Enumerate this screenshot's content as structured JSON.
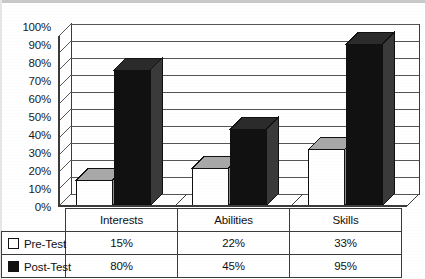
{
  "chart_data": {
    "type": "bar",
    "title": "",
    "subtitle": "",
    "xlabel": "",
    "ylabel": "",
    "categories": [
      "Interests",
      "Abilities",
      "Skills"
    ],
    "series": [
      {
        "name": "Pre-Test",
        "values": [
          15,
          22,
          33
        ],
        "color": "#ffffff",
        "marker": "hollow-square"
      },
      {
        "name": "Post-Test",
        "values": [
          80,
          45,
          95
        ],
        "color": "#111111",
        "marker": "filled-square"
      }
    ],
    "value_labels": {
      "Pre-Test": [
        "15%",
        "22%",
        "33%"
      ],
      "Post-Test": [
        "80%",
        "45%",
        "95%"
      ]
    },
    "ylim": [
      0,
      100
    ],
    "ytick_step": 10,
    "ytick_labels": [
      "100%",
      "90%",
      "80%",
      "70%",
      "60%",
      "50%",
      "40%",
      "30%",
      "20%",
      "10%",
      "0%"
    ],
    "ytick_values": [
      100,
      90,
      80,
      70,
      60,
      50,
      40,
      30,
      20,
      10,
      0
    ],
    "grid": true,
    "grid_axis": "y",
    "legend_position": "data-table-left",
    "three_d": true,
    "data_table_visible": true
  },
  "table": {
    "legend_header": "",
    "column_headers": [
      "Interests",
      "Abilities",
      "Skills"
    ],
    "rows": [
      {
        "label": "Pre-Test",
        "marker": "hollow-square",
        "cells": [
          "15%",
          "22%",
          "33%"
        ]
      },
      {
        "label": "Post-Test",
        "marker": "filled-square",
        "cells": [
          "80%",
          "45%",
          "95%"
        ]
      }
    ]
  },
  "axis": {
    "y_ticks": [
      "100%",
      "90%",
      "80%",
      "70%",
      "60%",
      "50%",
      "40%",
      "30%",
      "20%",
      "10%",
      "0%"
    ]
  },
  "colors": {
    "pre_test": "#ffffff",
    "post_test": "#111111",
    "bar_top_face": "#a8a8a8",
    "bar_side_face": "#3a3a3a",
    "gridline": "#555555",
    "frame": "#3b3b3b",
    "background": "#ffffff"
  }
}
